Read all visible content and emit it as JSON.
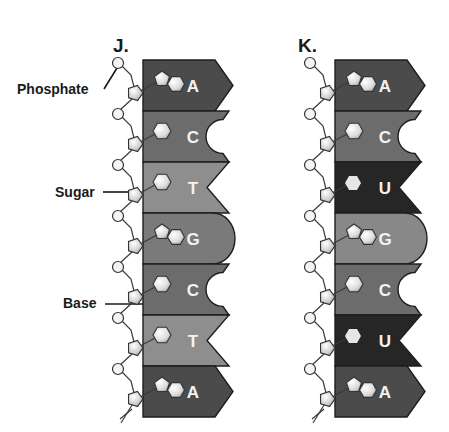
{
  "colors": {
    "A": "#4b4b4b",
    "C": "#6c6c6c",
    "T": "#8e8e8e",
    "G": "#7a7a7a",
    "U": "#262626",
    "G_rna": "#888888"
  },
  "labels": {
    "phosphate": "Phosphate",
    "sugar": "Sugar",
    "base": "Base"
  },
  "panels": [
    {
      "id": "J",
      "title": "J.",
      "strand_type": "DNA",
      "bases": [
        "A",
        "C",
        "T",
        "G",
        "C",
        "T",
        "A"
      ]
    },
    {
      "id": "K",
      "title": "K.",
      "strand_type": "RNA",
      "bases": [
        "A",
        "C",
        "U",
        "G",
        "C",
        "U",
        "A"
      ]
    }
  ]
}
